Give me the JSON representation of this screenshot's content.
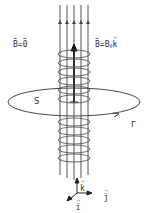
{
  "labels": {
    "outside_field_vec": "B",
    "outside_field_eq": "=",
    "outside_field_val": "0",
    "inside_field_vec": "B",
    "inside_field_eq": "=B",
    "inside_field_sub": "0",
    "inside_field_unit": "k",
    "surface": "S",
    "loop": "Γ",
    "axis_k": "k",
    "axis_j": "j",
    "axis_i": "i"
  },
  "colors": {
    "stroke": "#333333",
    "background": "#ffffff"
  }
}
